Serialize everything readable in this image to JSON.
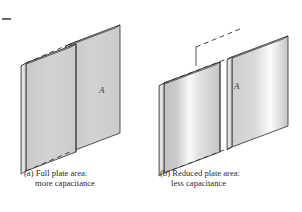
{
  "figure": {
    "background_color": "#ffffff",
    "line_color": "#2b2b2b",
    "plate_fill": "#cfcfcf",
    "plate_fill_light": "#e8e8e8",
    "plate_edge_fill": "#dcdcdc",
    "dash_color": "#3a3a3a"
  },
  "panel_a": {
    "id": "a",
    "area_label": "A",
    "caption_prefix": "(a)",
    "caption_line1": "Full plate area:",
    "caption_line2": "more capacitance",
    "caption_full": "(a) Full plate area: more capacitance"
  },
  "panel_b": {
    "id": "b",
    "area_label": "A",
    "caption_prefix": "(b)",
    "caption_line1": "Reduced plate area:",
    "caption_line2": "less capacitance",
    "caption_full": "(b) Reduced plate area: less capacitance"
  },
  "icons": {
    "edge_mark": "edge-tick-mark"
  }
}
